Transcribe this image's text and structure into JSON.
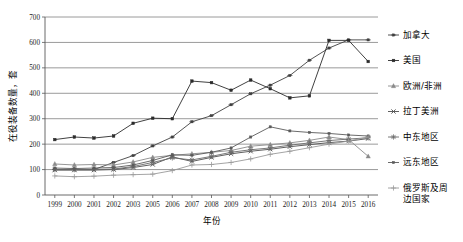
{
  "chart_data": {
    "type": "line",
    "title": "",
    "xlabel": "年份",
    "ylabel": "在役装备数量，套",
    "ylim": [
      0,
      700
    ],
    "ytick_values": [
      0,
      100,
      200,
      300,
      400,
      500,
      600,
      700
    ],
    "ytick_labels": [
      "0",
      "100",
      "200",
      "300",
      "400",
      "500",
      "600",
      "700"
    ],
    "grid": true,
    "grid_axis": "y",
    "legend_position": "right",
    "categories": [
      "1999",
      "2000",
      "2001",
      "2002",
      "2003",
      "2005",
      "2006",
      "2007",
      "2008",
      "2009",
      "2010",
      "2011",
      "2012",
      "2013",
      "2014",
      "2015",
      "2016"
    ],
    "series": [
      {
        "name": "加拿大",
        "marker": "plus-dot",
        "color": "#3f3f3f",
        "values": [
          100,
          100,
          100,
          128,
          155,
          193,
          228,
          288,
          312,
          355,
          398,
          432,
          470,
          530,
          578,
          610,
          610
        ]
      },
      {
        "name": "美国",
        "marker": "square",
        "color": "#2b2b2b",
        "values": [
          218,
          228,
          224,
          232,
          282,
          302,
          300,
          448,
          442,
          412,
          452,
          418,
          382,
          390,
          608,
          608,
          525
        ]
      },
      {
        "name": "欧洲/非洲",
        "marker": "triangle",
        "color": "#8a8a8a",
        "values": [
          122,
          118,
          120,
          118,
          130,
          148,
          156,
          162,
          168,
          175,
          192,
          198,
          205,
          215,
          228,
          218,
          152
        ]
      },
      {
        "name": "拉丁美洲",
        "marker": "cross",
        "color": "#4d4d4d",
        "values": [
          98,
          98,
          98,
          100,
          108,
          120,
          150,
          132,
          148,
          162,
          172,
          180,
          190,
          198,
          206,
          212,
          222
        ]
      },
      {
        "name": "中东地区",
        "marker": "asterisk",
        "color": "#6b6b6b",
        "values": [
          100,
          100,
          100,
          102,
          112,
          128,
          146,
          138,
          152,
          168,
          178,
          185,
          196,
          205,
          214,
          220,
          225
        ]
      },
      {
        "name": "远东地区",
        "marker": "square-small",
        "color": "#5a5a5a",
        "values": [
          106,
          104,
          106,
          108,
          118,
          136,
          158,
          156,
          168,
          185,
          228,
          268,
          252,
          246,
          242,
          236,
          232
        ]
      },
      {
        "name": "俄罗斯及周边国家",
        "marker": "plus",
        "color": "#9a9a9a",
        "values": [
          75,
          72,
          74,
          78,
          80,
          82,
          96,
          118,
          120,
          128,
          142,
          160,
          172,
          186,
          200,
          212,
          228
        ]
      }
    ]
  },
  "legend": {
    "items": [
      {
        "label": "加拿大"
      },
      {
        "label": "美国"
      },
      {
        "label": "欧洲/非洲"
      },
      {
        "label": "拉丁美洲"
      },
      {
        "label": "中东地区"
      },
      {
        "label": "远东地区"
      },
      {
        "label": "俄罗斯及周",
        "label2": "边国家"
      }
    ]
  }
}
